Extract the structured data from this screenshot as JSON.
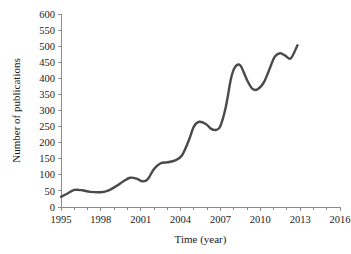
{
  "chart_data": {
    "type": "line",
    "title": "",
    "subtitle": "",
    "xlabel": "Time (year)",
    "ylabel": "Number of publications",
    "xlim": [
      1995,
      2016
    ],
    "ylim": [
      0,
      600
    ],
    "grid": false,
    "legend": null,
    "legend_position": "none",
    "line_color": "#4a4a4a",
    "axis_color": "#8a8a8a",
    "background_color": "#ffffff",
    "x_ticks": [
      1995,
      1998,
      2001,
      2004,
      2007,
      2010,
      2013,
      2016
    ],
    "x_tick_labels": [
      "1995",
      "1998",
      "2001",
      "2004",
      "2007",
      "2010",
      "2013",
      "2016"
    ],
    "x_minor_tick_step": 1,
    "y_ticks": [
      0,
      50,
      100,
      150,
      200,
      250,
      300,
      350,
      400,
      450,
      500,
      550,
      600
    ],
    "y_tick_labels": [
      "0",
      "50",
      "100",
      "150",
      "200",
      "250",
      "300",
      "350",
      "400",
      "450",
      "500",
      "550",
      "600"
    ],
    "series": [
      {
        "name": "Number of publications",
        "color": "#4a4a4a",
        "x": [
          1995.0,
          1995.5,
          1996.0,
          1996.6,
          1997.2,
          1998.0,
          1998.6,
          1999.2,
          1999.7,
          2000.2,
          2000.7,
          2001.1,
          2001.5,
          2002.0,
          2002.5,
          2003.0,
          2003.6,
          2004.1,
          2004.6,
          2005.0,
          2005.4,
          2005.9,
          2006.3,
          2006.7,
          2007.0,
          2007.4,
          2007.8,
          2008.1,
          2008.5,
          2009.0,
          2009.4,
          2009.8,
          2010.3,
          2010.8,
          2011.1,
          2011.5,
          2011.9,
          2012.3,
          2012.8
        ],
        "y": [
          32,
          42,
          53,
          52,
          47,
          46,
          52,
          66,
          80,
          91,
          88,
          80,
          85,
          118,
          136,
          139,
          145,
          160,
          205,
          250,
          265,
          258,
          243,
          240,
          252,
          310,
          400,
          435,
          440,
          395,
          368,
          366,
          390,
          440,
          468,
          478,
          470,
          462,
          503
        ]
      }
    ],
    "annotations": []
  }
}
